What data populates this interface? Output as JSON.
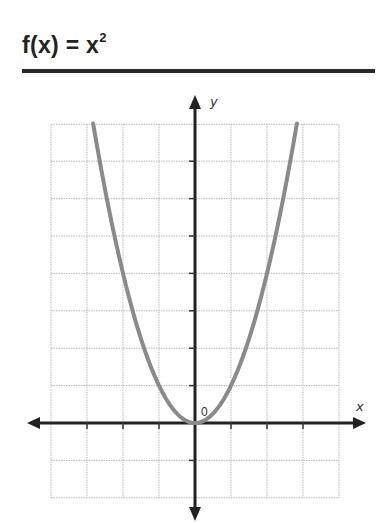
{
  "header": {
    "title_base": "f(x) = x",
    "title_exponent": "2"
  },
  "chart_data": {
    "type": "line",
    "function": "x^2",
    "xlabel": "x",
    "ylabel": "y",
    "origin_label": "0",
    "xlim": [
      -4,
      4
    ],
    "ylim": [
      -2,
      8
    ],
    "grid": true,
    "grid_step": 1,
    "series": [
      {
        "name": "f(x) = x^2",
        "color": "#8a8a8a",
        "x": [
          -2.83,
          -2.5,
          -2,
          -1.5,
          -1,
          -0.5,
          0,
          0.5,
          1,
          1.5,
          2,
          2.5,
          2.83
        ],
        "y": [
          8.0,
          6.25,
          4,
          2.25,
          1,
          0.25,
          0,
          0.25,
          1,
          2.25,
          4,
          6.25,
          8.0
        ]
      }
    ]
  },
  "colors": {
    "axis": "#222222",
    "grid": "#b8b8b8",
    "curve": "#8a8a8a",
    "rule": "#2a2a2a"
  }
}
